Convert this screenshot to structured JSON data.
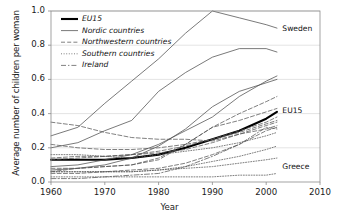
{
  "chart_data": {
    "type": "line",
    "title": "",
    "xlabel": "Year",
    "ylabel": "Average number of children per woman",
    "xlim": [
      1960,
      2010
    ],
    "ylim": [
      0.0,
      1.0
    ],
    "xticks": [
      "1960",
      "1970",
      "1980",
      "1990",
      "2000",
      "2010"
    ],
    "xtick_values": [
      1960,
      1970,
      1980,
      1990,
      2000,
      2010
    ],
    "yticks": [
      "0.0",
      "0.2",
      "0.4",
      "0.6",
      "0.8",
      "1.0"
    ],
    "ytick_values": [
      0.0,
      0.2,
      0.4,
      0.6,
      0.8,
      1.0
    ],
    "grid": "horizontal",
    "legend_position": "top-left-inside",
    "legend": [
      {
        "label": "EU15",
        "style": "thick-solid"
      },
      {
        "label": "Nordic countries",
        "style": "thin-solid"
      },
      {
        "label": "Northwestern countries",
        "style": "dashed"
      },
      {
        "label": "Southern countries",
        "style": "dotted"
      },
      {
        "label": "Ireland",
        "style": "dash-dot"
      }
    ],
    "annotations": [
      {
        "text": "Sweden",
        "x": 2003,
        "y": 0.895
      },
      {
        "text": "EU15",
        "x": 2003,
        "y": 0.415
      },
      {
        "text": "Greece",
        "x": 2003,
        "y": 0.085
      }
    ],
    "series": [
      {
        "name": "EU15",
        "group": "EU15",
        "style": "thick-solid",
        "x": [
          1960,
          1965,
          1970,
          1975,
          1980,
          1985,
          1990,
          1995,
          2000,
          2002
        ],
        "values": [
          0.13,
          0.13,
          0.13,
          0.14,
          0.16,
          0.2,
          0.25,
          0.3,
          0.37,
          0.41
        ]
      },
      {
        "name": "Sweden",
        "group": "Nordic countries",
        "style": "thin-solid",
        "x": [
          1960,
          1965,
          1970,
          1975,
          1980,
          1985,
          1990,
          1995,
          2000,
          2002
        ],
        "values": [
          0.27,
          0.32,
          0.46,
          0.59,
          0.72,
          0.87,
          1.0,
          0.96,
          0.92,
          0.9
        ]
      },
      {
        "name": "Denmark",
        "group": "Nordic countries",
        "style": "thin-solid",
        "x": [
          1960,
          1965,
          1970,
          1975,
          1980,
          1985,
          1990,
          1995,
          2000,
          2002
        ],
        "values": [
          0.2,
          0.23,
          0.3,
          0.36,
          0.53,
          0.64,
          0.73,
          0.78,
          0.78,
          0.76
        ]
      },
      {
        "name": "Finland",
        "group": "Nordic countries",
        "style": "thin-solid",
        "x": [
          1960,
          1965,
          1970,
          1975,
          1980,
          1985,
          1990,
          1995,
          2000,
          2002
        ],
        "values": [
          0.09,
          0.1,
          0.13,
          0.16,
          0.22,
          0.3,
          0.38,
          0.5,
          0.59,
          0.62
        ]
      },
      {
        "name": "Norway",
        "group": "Nordic countries",
        "style": "thin-solid",
        "x": [
          1960,
          1965,
          1970,
          1975,
          1980,
          1985,
          1990,
          1995,
          2000,
          2002
        ],
        "values": [
          0.07,
          0.08,
          0.1,
          0.14,
          0.21,
          0.31,
          0.44,
          0.53,
          0.58,
          0.6
        ]
      },
      {
        "name": "France",
        "group": "Northwestern countries",
        "style": "dashed",
        "x": [
          1960,
          1965,
          1970,
          1975,
          1980,
          1985,
          1990,
          1995,
          2000,
          2002
        ],
        "values": [
          0.08,
          0.08,
          0.09,
          0.1,
          0.14,
          0.22,
          0.32,
          0.4,
          0.47,
          0.5
        ]
      },
      {
        "name": "United Kingdom",
        "group": "Northwestern countries",
        "style": "dashed",
        "x": [
          1960,
          1965,
          1970,
          1975,
          1980,
          1985,
          1990,
          1995,
          2000,
          2002
        ],
        "values": [
          0.06,
          0.08,
          0.09,
          0.1,
          0.13,
          0.22,
          0.32,
          0.36,
          0.41,
          0.43
        ]
      },
      {
        "name": "Austria",
        "group": "Northwestern countries",
        "style": "dashed",
        "x": [
          1960,
          1965,
          1970,
          1975,
          1980,
          1985,
          1990,
          1995,
          2000,
          2002
        ],
        "values": [
          0.35,
          0.33,
          0.29,
          0.26,
          0.25,
          0.25,
          0.24,
          0.28,
          0.31,
          0.33
        ]
      },
      {
        "name": "Germany",
        "group": "Northwestern countries",
        "style": "dashed",
        "x": [
          1960,
          1965,
          1970,
          1975,
          1980,
          1985,
          1990,
          1995,
          2000,
          2002
        ],
        "values": [
          0.22,
          0.2,
          0.19,
          0.19,
          0.2,
          0.22,
          0.25,
          0.3,
          0.35,
          0.38
        ]
      },
      {
        "name": "Netherlands",
        "group": "Northwestern countries",
        "style": "dashed",
        "x": [
          1960,
          1965,
          1970,
          1975,
          1980,
          1985,
          1990,
          1995,
          2000,
          2002
        ],
        "values": [
          0.05,
          0.05,
          0.06,
          0.07,
          0.08,
          0.11,
          0.16,
          0.22,
          0.3,
          0.32
        ]
      },
      {
        "name": "Belgium",
        "group": "Northwestern countries",
        "style": "dashed",
        "x": [
          1960,
          1965,
          1970,
          1975,
          1980,
          1985,
          1990,
          1995,
          2000,
          2002
        ],
        "values": [
          0.13,
          0.14,
          0.15,
          0.16,
          0.17,
          0.19,
          0.23,
          0.28,
          0.33,
          0.35
        ]
      },
      {
        "name": "Luxembourg",
        "group": "Northwestern countries",
        "style": "dashed",
        "x": [
          1960,
          1965,
          1970,
          1975,
          1980,
          1985,
          1990,
          1995,
          2000,
          2002
        ],
        "values": [
          0.14,
          0.15,
          0.15,
          0.16,
          0.18,
          0.21,
          0.25,
          0.29,
          0.34,
          0.36
        ]
      },
      {
        "name": "Portugal",
        "group": "Southern countries",
        "style": "dotted",
        "x": [
          1960,
          1965,
          1970,
          1975,
          1980,
          1985,
          1990,
          1995,
          2000,
          2002
        ],
        "values": [
          0.16,
          0.16,
          0.15,
          0.14,
          0.16,
          0.18,
          0.2,
          0.23,
          0.27,
          0.29
        ]
      },
      {
        "name": "Spain",
        "group": "Southern countries",
        "style": "dotted",
        "x": [
          1960,
          1965,
          1970,
          1975,
          1980,
          1985,
          1990,
          1995,
          2000,
          2002
        ],
        "values": [
          0.06,
          0.06,
          0.06,
          0.06,
          0.07,
          0.09,
          0.12,
          0.15,
          0.19,
          0.21
        ]
      },
      {
        "name": "Italy",
        "group": "Southern countries",
        "style": "dotted",
        "x": [
          1960,
          1965,
          1970,
          1975,
          1980,
          1985,
          1990,
          1995,
          2000,
          2002
        ],
        "values": [
          0.06,
          0.06,
          0.06,
          0.06,
          0.07,
          0.08,
          0.09,
          0.11,
          0.13,
          0.14
        ]
      },
      {
        "name": "Greece",
        "group": "Southern countries",
        "style": "dotted",
        "x": [
          1960,
          1965,
          1970,
          1975,
          1980,
          1985,
          1990,
          1995,
          2000,
          2002
        ],
        "values": [
          0.03,
          0.03,
          0.03,
          0.03,
          0.03,
          0.03,
          0.03,
          0.04,
          0.04,
          0.05
        ]
      },
      {
        "name": "Ireland",
        "group": "Ireland",
        "style": "dash-dot",
        "x": [
          1960,
          1965,
          1970,
          1975,
          1980,
          1985,
          1990,
          1995,
          2000,
          2002
        ],
        "values": [
          0.02,
          0.02,
          0.03,
          0.04,
          0.05,
          0.09,
          0.15,
          0.22,
          0.32,
          0.31
        ]
      }
    ]
  }
}
